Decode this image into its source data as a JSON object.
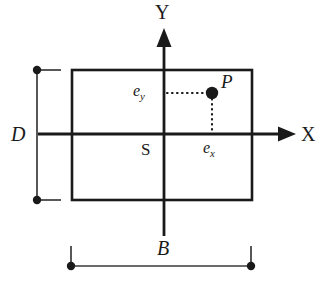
{
  "figure": {
    "type": "engineering-cross-section-diagram",
    "stroke_color": "#1a1a1a",
    "background_color": "#ffffff"
  },
  "axes": {
    "x_axis": {
      "label": "X",
      "direction": "right",
      "arrowhead": true,
      "y_position": 134,
      "start_x": 38,
      "end_x": 296,
      "label_x": 301,
      "label_y": 124
    },
    "y_axis": {
      "label": "Y",
      "direction": "up",
      "arrowhead": true,
      "x_position": 164,
      "start_y": 236,
      "end_y": 28,
      "label_x": 155,
      "label_y": 2
    },
    "origin": {
      "label": "S",
      "label_x": 141,
      "label_y": 141
    }
  },
  "section": {
    "name": "rectangular-cross-section",
    "left": 72,
    "top": 70,
    "right": 252,
    "bottom": 200,
    "width": 180,
    "height": 130,
    "stroke_width": 2.6,
    "fill": "none"
  },
  "load_point": {
    "label": "P",
    "x": 212,
    "y": 93,
    "marker_radius": 6.2,
    "label_x": 221,
    "label_y": 72
  },
  "eccentricities": {
    "ey": {
      "label": "e",
      "subscript": "y",
      "label_x": 133,
      "label_y": 83,
      "leader_from_x": 166,
      "leader_to_x": 208,
      "leader_y": 93,
      "style": "dotted"
    },
    "ex": {
      "label": "e",
      "subscript": "x",
      "label_x": 203,
      "label_y": 140,
      "leader_x": 212,
      "leader_from_y": 99,
      "leader_to_y": 133,
      "style": "dotted"
    }
  },
  "dimensions": [
    {
      "name": "depth-dimension",
      "label": "D",
      "orientation": "vertical",
      "line_x": 37,
      "from_y": 70,
      "to_y": 200,
      "endpoint_marker": "dot",
      "marker_radius": 4.2,
      "extension_lines": [
        {
          "from_x": 37,
          "to_x": 60,
          "y": 70
        },
        {
          "from_x": 37,
          "to_x": 60,
          "y": 200
        }
      ],
      "label_x": 11,
      "label_y": 124
    },
    {
      "name": "breadth-dimension",
      "label": "B",
      "orientation": "horizontal",
      "line_y": 266,
      "from_x": 71,
      "to_x": 251,
      "endpoint_marker": "dot",
      "marker_radius": 4.2,
      "extension_lines": [
        {
          "x": 71,
          "from_y": 247,
          "to_y": 266
        },
        {
          "x": 251,
          "from_y": 247,
          "to_y": 266
        }
      ],
      "label_x": 157,
      "label_y": 238
    }
  ]
}
